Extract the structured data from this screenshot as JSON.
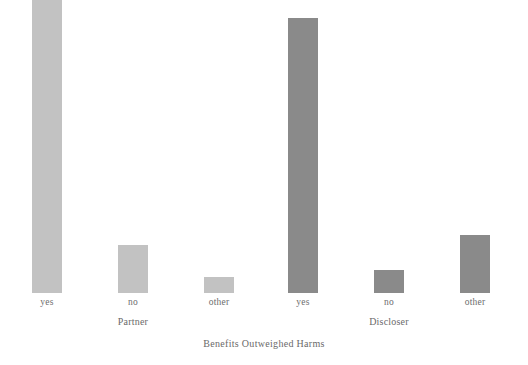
{
  "chart_data": {
    "type": "bar",
    "title": "",
    "xlabel": "Benefits Outweighed Harms",
    "ylabel": "",
    "grid": false,
    "legend": "none",
    "ylim": [
      0,
      264
    ],
    "groups": [
      {
        "name": "Partner",
        "color": "#c2c2c2",
        "categories": [
          "yes",
          "no",
          "other"
        ],
        "values": [
          264,
          43,
          14
        ]
      },
      {
        "name": "Discloser",
        "color": "#8a8a8a",
        "categories": [
          "yes",
          "no",
          "other"
        ],
        "values": [
          248,
          21,
          52
        ]
      }
    ],
    "bars": [
      {
        "group": "Partner",
        "category": "yes",
        "value": 264,
        "color": "#c2c2c2",
        "x": 32,
        "width": 30
      },
      {
        "group": "Partner",
        "category": "no",
        "value": 43,
        "color": "#c2c2c2",
        "x": 118,
        "width": 30
      },
      {
        "group": "Partner",
        "category": "other",
        "value": 14,
        "color": "#c2c2c2",
        "x": 204,
        "width": 30
      },
      {
        "group": "Discloser",
        "category": "yes",
        "value": 248,
        "color": "#8a8a8a",
        "x": 288,
        "width": 30
      },
      {
        "group": "Discloser",
        "category": "no",
        "value": 21,
        "color": "#8a8a8a",
        "x": 374,
        "width": 30
      },
      {
        "group": "Discloser",
        "category": "other",
        "value": 52,
        "color": "#8a8a8a",
        "x": 460,
        "width": 30
      }
    ],
    "category_labels": [
      {
        "text": "yes",
        "center": 47
      },
      {
        "text": "no",
        "center": 133
      },
      {
        "text": "other",
        "center": 219
      },
      {
        "text": "yes",
        "center": 303
      },
      {
        "text": "no",
        "center": 389
      },
      {
        "text": "other",
        "center": 475
      }
    ],
    "group_labels": [
      {
        "text": "Partner",
        "center": 133
      },
      {
        "text": "Discloser",
        "center": 389
      }
    ]
  },
  "colors": {
    "background": "#ffffff",
    "bar_light": "#c2c2c2",
    "bar_dark": "#8a8a8a",
    "text": "#6a6a6a"
  }
}
